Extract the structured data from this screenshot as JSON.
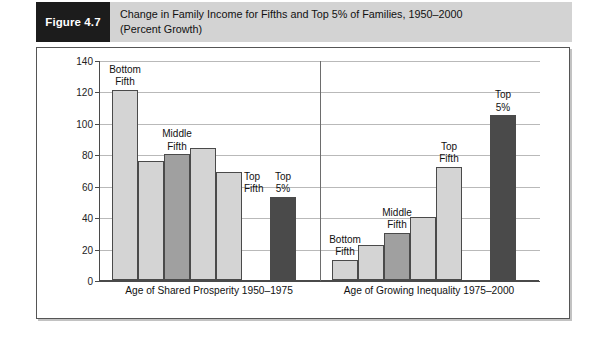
{
  "figure": {
    "badge": "Figure 4.7",
    "caption_line1": "Change in Family Income for Fifths and Top 5% of Families, 1950–2000",
    "caption_line2": "(Percent Growth)"
  },
  "colors": {
    "header_band": "#d3d3d3",
    "badge_bg": "#1c1c1c",
    "bar_light": "#d4d4d4",
    "bar_mid": "#a0a0a0",
    "bar_dark": "#4a4a4a",
    "grid": "#b9b9b9",
    "axis": "#4a4a4a"
  },
  "chart_data": {
    "type": "bar",
    "title": "Change in Family Income for Fifths and Top 5% of Families, 1950–2000",
    "subtitle": "(Percent Growth)",
    "xlabel": "",
    "ylabel": "",
    "ylim": [
      0,
      140
    ],
    "yticks": [
      0,
      20,
      40,
      60,
      80,
      100,
      120,
      140
    ],
    "ytick_labels": [
      "0",
      "20",
      "40",
      "60",
      "80",
      "100",
      "120",
      "140"
    ],
    "grid": true,
    "legend": "none",
    "groups": [
      {
        "label": "Age of Shared Prosperity 1950–1975",
        "bars": [
          {
            "category": "Bottom Fifth",
            "value": 121,
            "shade": "light",
            "note": [
              "Bottom",
              "Fifth"
            ],
            "note_position": "above"
          },
          {
            "category": "Second Fifth",
            "value": 76,
            "shade": "light",
            "note": [],
            "note_position": "none"
          },
          {
            "category": "Middle Fifth",
            "value": 80,
            "shade": "mid",
            "note": [
              "Middle",
              "Fifth"
            ],
            "note_position": "above"
          },
          {
            "category": "Fourth Fifth",
            "value": 84,
            "shade": "light",
            "note": [],
            "note_position": "none"
          },
          {
            "category": "Top Fifth",
            "value": 69,
            "shade": "light",
            "note": [
              "Top",
              "Fifth"
            ],
            "note_position": "right"
          },
          {
            "category": "Top 5%",
            "value": 53,
            "shade": "dark",
            "note": [
              "Top",
              "5%"
            ],
            "note_position": "above"
          }
        ]
      },
      {
        "label": "Age of Growing Inequality 1975–2000",
        "bars": [
          {
            "category": "Bottom Fifth",
            "value": 13,
            "shade": "light",
            "note": [
              "Bottom",
              "Fifth"
            ],
            "note_position": "above"
          },
          {
            "category": "Second Fifth",
            "value": 22,
            "shade": "light",
            "note": [],
            "note_position": "none"
          },
          {
            "category": "Middle Fifth",
            "value": 30,
            "shade": "mid",
            "note": [
              "Middle",
              "Fifth"
            ],
            "note_position": "above"
          },
          {
            "category": "Fourth Fifth",
            "value": 40,
            "shade": "light",
            "note": [],
            "note_position": "none"
          },
          {
            "category": "Top Fifth",
            "value": 72,
            "shade": "light",
            "note": [
              "Top",
              "Fifth"
            ],
            "note_position": "above"
          },
          {
            "category": "Top 5%",
            "value": 105,
            "shade": "dark",
            "note": [
              "Top",
              "5%"
            ],
            "note_position": "above"
          }
        ]
      }
    ]
  }
}
